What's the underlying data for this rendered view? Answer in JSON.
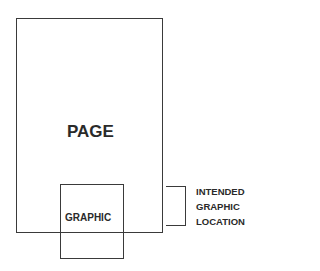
{
  "diagram": {
    "page": {
      "label": "PAGE"
    },
    "graphic": {
      "label": "GRAPHIC"
    },
    "annotation": {
      "lines": [
        "INTENDED",
        "GRAPHIC",
        "LOCATION"
      ]
    }
  }
}
